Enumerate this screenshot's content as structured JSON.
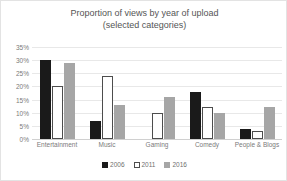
{
  "chart_data": {
    "type": "bar",
    "title": "Proportion of views by year of upload\n(selected categories)",
    "xlabel": "",
    "ylabel": "",
    "ylim": [
      0,
      35
    ],
    "ytick_suffix": "%",
    "yticks": [
      35,
      30,
      25,
      20,
      15,
      10,
      5,
      0
    ],
    "ytick_labels": [
      "35%",
      "30%",
      "25%",
      "20%",
      "15%",
      "10%",
      "5%",
      "0%"
    ],
    "grid": true,
    "legend_position": "bottom",
    "categories": [
      "Entertainment",
      "Music",
      "Gaming",
      "Comedy",
      "People & Blogs"
    ],
    "series": [
      {
        "name": "2006",
        "color": "#1a1a1a",
        "values": [
          30,
          7,
          0,
          18,
          4
        ]
      },
      {
        "name": "2011",
        "color": "#ffffff",
        "values": [
          20,
          24,
          10,
          12,
          3
        ]
      },
      {
        "name": "2016",
        "color": "#a6a6a6",
        "values": [
          29,
          13,
          16,
          10,
          12
        ]
      }
    ]
  },
  "legend": {
    "items": [
      {
        "label": "2006"
      },
      {
        "label": "2011"
      },
      {
        "label": "2016"
      }
    ]
  }
}
